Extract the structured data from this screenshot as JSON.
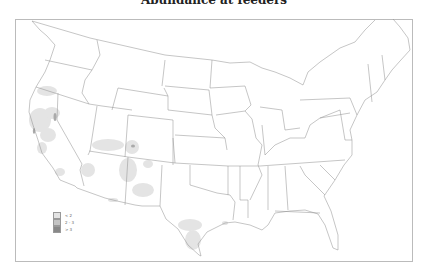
{
  "title": "Abundance at feeders",
  "legend": [
    {
      "label": "< 2",
      "color": "#e3e3e3"
    },
    {
      "label": "2 - 3",
      "color": "#c4c4c4"
    },
    {
      "label": "> 3",
      "color": "#888888"
    }
  ],
  "colors": {
    "border": "#999999",
    "state_line": "#8c8c8c",
    "frame": "#bbbbbb"
  }
}
